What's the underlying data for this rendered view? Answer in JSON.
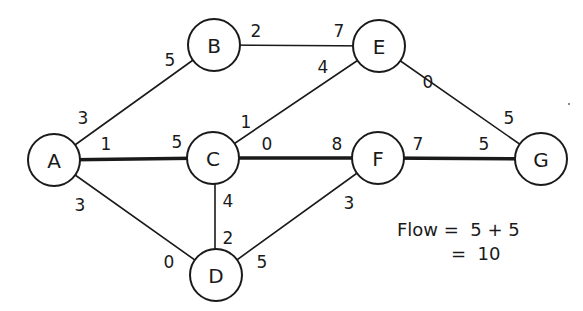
{
  "diagram": {
    "type": "network-flow-graph",
    "colors": {
      "stroke": "#1a1a1a",
      "background": "#ffffff"
    },
    "nodes": [
      {
        "id": "A",
        "label": "A",
        "x": 54,
        "y": 160
      },
      {
        "id": "B",
        "label": "B",
        "x": 214,
        "y": 45
      },
      {
        "id": "C",
        "label": "C",
        "x": 213,
        "y": 158
      },
      {
        "id": "D",
        "label": "D",
        "x": 216,
        "y": 275
      },
      {
        "id": "E",
        "label": "E",
        "x": 379,
        "y": 46
      },
      {
        "id": "F",
        "label": "F",
        "x": 378,
        "y": 158
      },
      {
        "id": "G",
        "label": "G",
        "x": 541,
        "y": 159
      }
    ],
    "edges": [
      {
        "from": "A",
        "to": "B",
        "thick": false,
        "label_from": "3",
        "label_to": "5"
      },
      {
        "from": "A",
        "to": "C",
        "thick": true,
        "label_from": "1",
        "label_to": "5"
      },
      {
        "from": "A",
        "to": "D",
        "thick": false,
        "label_from": "3",
        "label_to": "0"
      },
      {
        "from": "B",
        "to": "E",
        "thick": false,
        "label_from": "2",
        "label_to": "7"
      },
      {
        "from": "C",
        "to": "E",
        "thick": false,
        "label_from": "1",
        "label_to": "4"
      },
      {
        "from": "C",
        "to": "F",
        "thick": true,
        "label_from": "0",
        "label_to": "8"
      },
      {
        "from": "C",
        "to": "D",
        "thick": false,
        "label_from": "4",
        "label_to": "2"
      },
      {
        "from": "D",
        "to": "F",
        "thick": false,
        "label_from": "5",
        "label_to": "3"
      },
      {
        "from": "E",
        "to": "G",
        "thick": false,
        "label_from": "0",
        "label_to": "5"
      },
      {
        "from": "F",
        "to": "G",
        "thick": true,
        "label_from": "7",
        "label_to": "5"
      }
    ],
    "edge_labels": {
      "ab_near_a": "3",
      "ab_near_b": "5",
      "ac_near_a": "1",
      "ac_near_c": "5",
      "ad_near_a": "3",
      "ad_near_d": "0",
      "be_near_b": "2",
      "be_near_e": "7",
      "ce_near_c": "1",
      "ce_near_e": "4",
      "cf_near_c": "0",
      "cf_near_f": "8",
      "cd_near_c": "4",
      "cd_near_d": "2",
      "df_near_d": "5",
      "df_near_f": "3",
      "eg_near_e": "0",
      "eg_near_g": "5",
      "fg_near_f": "7",
      "fg_near_g": "5"
    },
    "flow": {
      "line1": "Flow =  5 + 5",
      "line2": "=  10"
    }
  }
}
